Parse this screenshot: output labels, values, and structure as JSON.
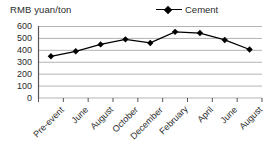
{
  "chart_data": {
    "type": "line",
    "title": "RMB yuan/ton",
    "xlabel": "",
    "ylabel": "RMB yuan/ton",
    "categories": [
      "Pre-event",
      "June",
      "August",
      "October",
      "December",
      "February",
      "April",
      "June",
      "August"
    ],
    "series": [
      {
        "name": "Cement",
        "values": [
          350,
          392,
          450,
          492,
          462,
          555,
          545,
          487,
          407
        ],
        "marker": "diamond",
        "color": "#000000"
      }
    ],
    "ylim": [
      0,
      600
    ],
    "yticks": [
      0,
      100,
      200,
      300,
      400,
      500,
      600
    ],
    "ytick_labels": [
      "0",
      "100",
      "200",
      "300",
      "400",
      "500",
      "600"
    ],
    "grid": true,
    "grid_axis": "y",
    "grid_color": "#b3b3b3",
    "legend": {
      "position": "top-right",
      "entries": [
        "Cement"
      ]
    }
  },
  "legend": {
    "label": "Cement",
    "marker_name": "diamond-marker"
  },
  "axes": {
    "y_title": "RMB yuan/ton"
  }
}
